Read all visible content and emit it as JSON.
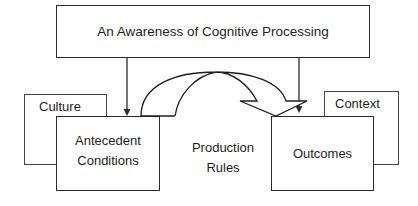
{
  "diagram": {
    "top_box": {
      "label": "An Awareness of Cognitive Processing"
    },
    "culture_box": {
      "label": "Culture"
    },
    "antecedent_box": {
      "label_line1": "Antecedent",
      "label_line2": "Conditions"
    },
    "production_rules": {
      "label_line1": "Production",
      "label_line2": "Rules"
    },
    "outcomes_box": {
      "label": "Outcomes"
    },
    "context_box": {
      "label": "Context"
    },
    "edges": [
      {
        "from": "An Awareness of Cognitive Processing",
        "to": "Antecedent Conditions",
        "type": "arrow"
      },
      {
        "from": "An Awareness of Cognitive Processing",
        "to": "Outcomes",
        "type": "arrow"
      },
      {
        "from": "Antecedent Conditions",
        "to": "Outcomes",
        "type": "curved-block-arrow",
        "label": "Production Rules"
      }
    ],
    "colors": {
      "stroke": "#2a2a2a",
      "background": "#ffffff",
      "text": "#1e1e1e"
    }
  }
}
